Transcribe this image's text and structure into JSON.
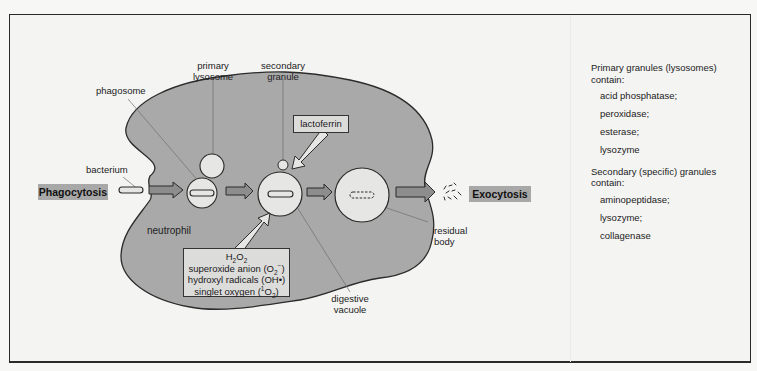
{
  "diagram": {
    "title_tags": {
      "phagocytosis": "Phagocytosis",
      "exocytosis": "Exocytosis"
    },
    "labels": {
      "bacterium": "bacterium",
      "phagosome": "phagosome",
      "primary_lysosome_1": "primary",
      "primary_lysosome_2": "lysosome",
      "secondary_granule_1": "secondary",
      "secondary_granule_2": "granule",
      "lactoferrin": "lactoferrin",
      "neutrophil": "neutrophil",
      "digestive_vacuole_1": "digestive",
      "digestive_vacuole_2": "vacuole",
      "residual_body_1": "residual",
      "residual_body_2": "body"
    },
    "oxidants_box": {
      "line1_main": "H",
      "line1_sub1": "2",
      "line1_mid": "O",
      "line1_sub2": "2",
      "line2_text": "superoxide anion (O",
      "line2_sub": "2",
      "line2_sup": "−",
      "line2_close": ")",
      "line3": "hydroxyl radicals (OH•)",
      "line4_text": "singlet oxygen (",
      "line4_sup": "1",
      "line4_mid": "O",
      "line4_sub": "2",
      "line4_close": ")"
    },
    "colors": {
      "cell_fill": "#a9a9a9",
      "vesicle_fill": "#e6e6e4",
      "tag_fill": "#a8a8a8",
      "background": "#f4f4f2",
      "outline": "#2b2b2b"
    }
  },
  "legend": {
    "primary": {
      "heading_1": "Primary granules (lysosomes)",
      "heading_2": "contain:",
      "items": [
        "acid phosphatase;",
        "peroxidase;",
        "esterase;",
        "lysozyme"
      ]
    },
    "secondary": {
      "heading_1": "Secondary (specific) granules",
      "heading_2": "contain:",
      "items": [
        "aminopeptidase;",
        "lysozyme;",
        "collagenase"
      ]
    }
  }
}
